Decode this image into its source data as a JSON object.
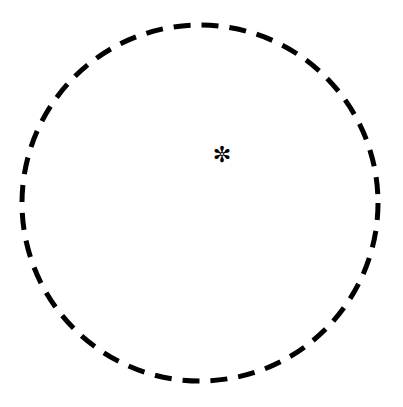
{
  "canvas": {
    "width": 403,
    "height": 407,
    "background_color": "#ffffff"
  },
  "figure": {
    "title": "",
    "shapes": [
      {
        "name": "dashed-circle",
        "type": "circle",
        "center_x": 200,
        "center_y": 203,
        "radius": 178,
        "stroke_color": "#000000",
        "stroke_width": 5,
        "fill": "none",
        "dash_length": 17,
        "dash_gap": 11,
        "dash_array": "17 11",
        "line_cap": "butt"
      },
      {
        "name": "sun-marker",
        "type": "glyph",
        "glyph": "✼",
        "glyph_name": "sun-icon",
        "center_x": 222,
        "center_y": 155,
        "size": 22,
        "color": "#000000"
      }
    ]
  },
  "labels": {
    "circle_label": "",
    "marker_label": ""
  }
}
